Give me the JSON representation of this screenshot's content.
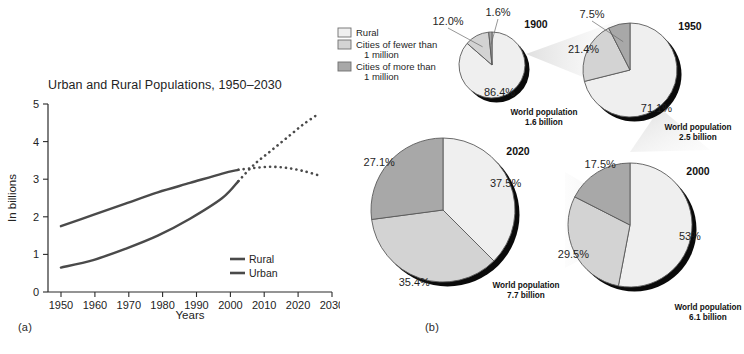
{
  "figure": {
    "panel_a_tag": "(a)",
    "panel_b_tag": "(b)"
  },
  "chart_data": [
    {
      "type": "line",
      "panel": "(a)",
      "title": "Urban and Rural Populations, 1950–2030",
      "xlabel": "Years",
      "ylabel": "In billions",
      "xlim": [
        1946,
        2034
      ],
      "ylim": [
        0,
        5
      ],
      "xticks": [
        "1950",
        "1960",
        "1970",
        "1980",
        "1990",
        "2000",
        "2010",
        "2020",
        "2030"
      ],
      "yticks": [
        "0",
        "1",
        "2",
        "3",
        "4",
        "5"
      ],
      "grid": false,
      "legend_position": "bottom-right",
      "line_color": "#4a4a4a",
      "series": [
        {
          "name": "Rural",
          "style_solid_until": 2005,
          "x": [
            1950,
            1960,
            1970,
            1980,
            1990,
            2000,
            2005,
            2010,
            2015,
            2020,
            2025,
            2030
          ],
          "values": [
            1.75,
            2.05,
            2.35,
            2.65,
            2.9,
            3.15,
            3.25,
            3.3,
            3.33,
            3.3,
            3.22,
            3.1
          ]
        },
        {
          "name": "Urban",
          "style_solid_until": 2005,
          "x": [
            1950,
            1960,
            1970,
            1980,
            1990,
            2000,
            2005,
            2010,
            2015,
            2020,
            2025,
            2030
          ],
          "values": [
            0.65,
            0.85,
            1.15,
            1.5,
            1.95,
            2.5,
            2.95,
            3.4,
            3.75,
            4.1,
            4.45,
            4.75
          ]
        }
      ],
      "legend": [
        "Rural",
        "Urban"
      ]
    },
    {
      "type": "pie",
      "panel": "(b)",
      "title": "",
      "legend_position": "top-left",
      "legend": [
        {
          "label": "Rural",
          "color": "#efefef"
        },
        {
          "label": "Cities of fewer than\n   1 million",
          "color": "#d3d3d3"
        },
        {
          "label": "Cities of more than\n   1 million",
          "color": "#a8a8a8"
        }
      ],
      "legend_entries": [
        {
          "line1": "Rural",
          "line2": ""
        },
        {
          "line1": "Cities of fewer than",
          "line2": "1 million"
        },
        {
          "line1": "Cities of more than",
          "line2": "1 million"
        }
      ],
      "categories": [
        "Rural",
        "Cities of fewer than 1 million",
        "Cities of more than 1 million"
      ],
      "colors": [
        "#efefef",
        "#d3d3d3",
        "#a8a8a8"
      ],
      "pies": [
        {
          "year": "1900",
          "caption_line1": "World population",
          "caption_line2": "1.6 billion",
          "values": [
            86.4,
            12.0,
            1.6
          ],
          "labels": [
            "86.4%",
            "12.0%",
            "1.6%"
          ]
        },
        {
          "year": "1950",
          "caption_line1": "World population",
          "caption_line2": "2.5 billion",
          "values": [
            71.1,
            21.4,
            7.5
          ],
          "labels": [
            "71.1%",
            "21.4%",
            "7.5%"
          ]
        },
        {
          "year": "2000",
          "caption_line1": "World population",
          "caption_line2": "6.1 billion",
          "values": [
            53.0,
            29.5,
            17.5
          ],
          "labels": [
            "53%",
            "29.5%",
            "17.5%"
          ]
        },
        {
          "year": "2020",
          "caption_line1": "World population",
          "caption_line2": "7.7 billion",
          "values": [
            37.5,
            35.4,
            27.1
          ],
          "labels": [
            "37.5%",
            "35.4%",
            "27.1%"
          ]
        }
      ]
    }
  ]
}
